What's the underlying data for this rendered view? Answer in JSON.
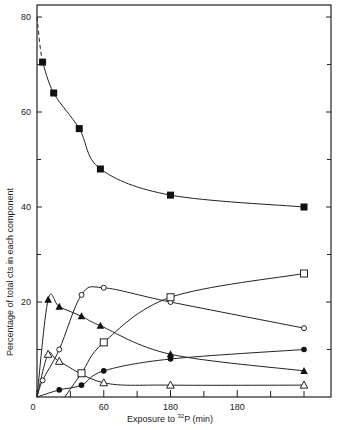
{
  "chart_data": {
    "type": "line",
    "title": "",
    "xlabel": "Exposure to 32P (min)",
    "xlabel_parts": {
      "prefix": "Exposure to ",
      "sup": "32",
      "suffix": "P (min)"
    },
    "ylabel": "Percentage of total cts in each component",
    "xlim": [
      0,
      240
    ],
    "ylim": [
      0,
      83
    ],
    "x_ticks": [
      0,
      60,
      120,
      180
    ],
    "x_tick_labels": [
      "0",
      "60",
      "180",
      "180"
    ],
    "x_minor_ticks": [
      30,
      90,
      150,
      210,
      240
    ],
    "y_ticks": [
      20,
      40,
      60,
      80
    ],
    "y_tick_labels": [
      "20",
      "40",
      "60",
      "80"
    ],
    "y_minor_ticks": [
      10,
      30,
      50,
      70
    ],
    "grid": false,
    "legend": null,
    "series": [
      {
        "name": "filled-squares",
        "marker": "filled-square",
        "x": [
          5,
          15,
          38,
          57,
          120,
          240
        ],
        "values": [
          70.5,
          64,
          56.5,
          48,
          42.5,
          40
        ],
        "curve_start": [
          0,
          80
        ],
        "dashed_start": true
      },
      {
        "name": "open-circles",
        "marker": "open-circle",
        "x": [
          5,
          20,
          40,
          60,
          120,
          240
        ],
        "values": [
          3.5,
          10,
          21.5,
          23,
          20,
          14.5
        ]
      },
      {
        "name": "open-squares",
        "marker": "open-square",
        "x": [
          40,
          60,
          120,
          240
        ],
        "values": [
          5,
          11.5,
          21,
          26
        ],
        "curve_start": [
          25,
          0
        ]
      },
      {
        "name": "filled-triangles",
        "marker": "filled-triangle",
        "x": [
          10,
          20,
          40,
          57,
          120,
          240
        ],
        "values": [
          20.5,
          19,
          17,
          15,
          9,
          5.5
        ]
      },
      {
        "name": "filled-circles",
        "marker": "filled-circle",
        "x": [
          20,
          40,
          60,
          120,
          240
        ],
        "values": [
          1.5,
          2.5,
          5.5,
          8,
          10
        ]
      },
      {
        "name": "open-triangles",
        "marker": "open-triangle",
        "x": [
          10,
          20,
          60,
          120,
          240
        ],
        "values": [
          9,
          7.5,
          3,
          2.5,
          2.5
        ]
      }
    ]
  }
}
